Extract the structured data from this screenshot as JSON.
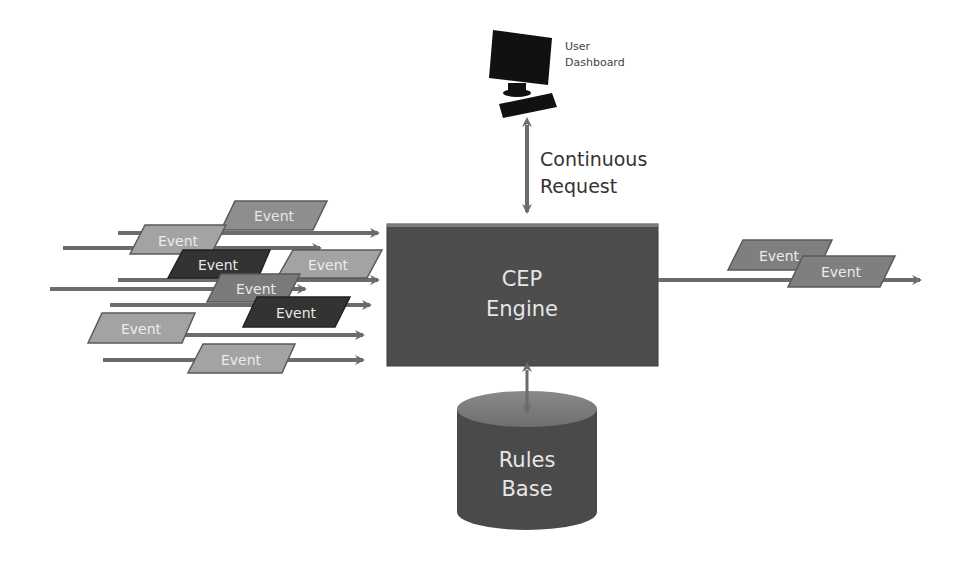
{
  "diagram": {
    "colors": {
      "arrow": "#6b6b6b",
      "engine_fill": "#4d4d4d",
      "event_light": "#9a9a9a",
      "event_mid": "#7a7a7a",
      "event_dark": "#3a3a3a",
      "event_text": "#e8e8e8",
      "text_dark": "#333333"
    },
    "user_dashboard": {
      "label_line1": "User",
      "label_line2": "Dashboard",
      "icon": "computer-icon"
    },
    "request_link": {
      "label_line1": "Continuous",
      "label_line2": "Request"
    },
    "engine": {
      "label_line1": "CEP",
      "label_line2": "Engine"
    },
    "rules_base": {
      "label_line1": "Rules",
      "label_line2": "Base",
      "icon": "database-cylinder"
    },
    "input_events": [
      {
        "label": "Event",
        "shade": "light"
      },
      {
        "label": "Event",
        "shade": "light"
      },
      {
        "label": "Event",
        "shade": "dark"
      },
      {
        "label": "Event",
        "shade": "light"
      },
      {
        "label": "Event",
        "shade": "mid"
      },
      {
        "label": "Event",
        "shade": "dark"
      },
      {
        "label": "Event",
        "shade": "light"
      },
      {
        "label": "Event",
        "shade": "light"
      }
    ],
    "output_events": [
      {
        "label": "Event",
        "shade": "mid"
      },
      {
        "label": "Event",
        "shade": "mid"
      }
    ]
  }
}
